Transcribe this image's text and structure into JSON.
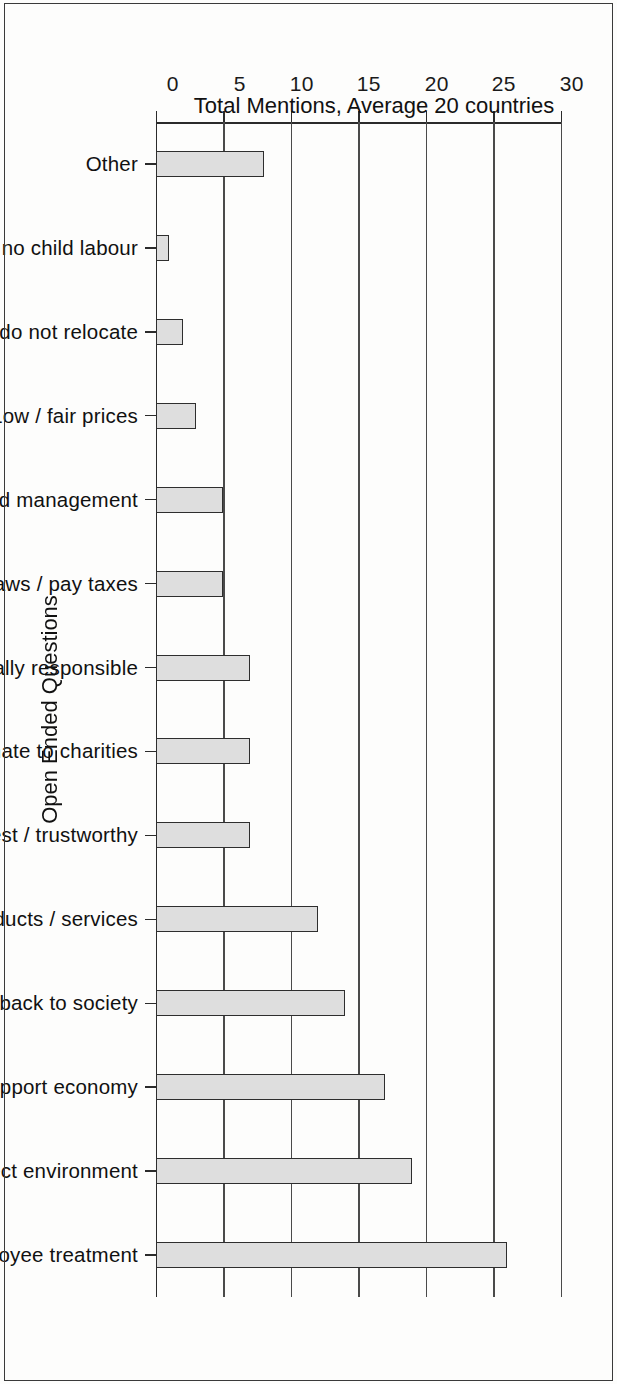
{
  "figure": {
    "background_color": "#fdfdfc",
    "border_color": "#3a3a3a",
    "bar_fill_color": "#dedede",
    "bar_edge_color": "#2e2e2e",
    "orientation_note": "chart printed sideways on the scanned page"
  },
  "chart_data": {
    "type": "bar",
    "title": "",
    "xlabel": "Open Ended Questions",
    "ylabel": "Total Mentions, Average 20 countries",
    "ylim": [
      0,
      30
    ],
    "ytick_labels": [
      "0",
      "5",
      "10",
      "15",
      "20",
      "25",
      "30"
    ],
    "yticks": [
      0,
      5,
      10,
      15,
      20,
      25,
      30
    ],
    "grid": "horizontal gridlines at every 5 units",
    "legend": "none",
    "categories": [
      "Other",
      "Protect human rights / no child labour",
      "Stay in country / do not relocate",
      "Low / fair prices",
      "Make profit / good management",
      "Obey laws / pay taxes",
      "Show concern / be socially responsible",
      "Donate to charities",
      "Be honest / trustworthy",
      "Good quality / safe products / services",
      "Provide social services / give back to society",
      "Create jobs / support economy",
      "Protect environment",
      "Fair employee treatment"
    ],
    "values": [
      8,
      1,
      2,
      3,
      5,
      5,
      7,
      7,
      7,
      12,
      14,
      17,
      19,
      26
    ]
  },
  "bleed_through": [
    "reverse-side show-through, illegible"
  ]
}
